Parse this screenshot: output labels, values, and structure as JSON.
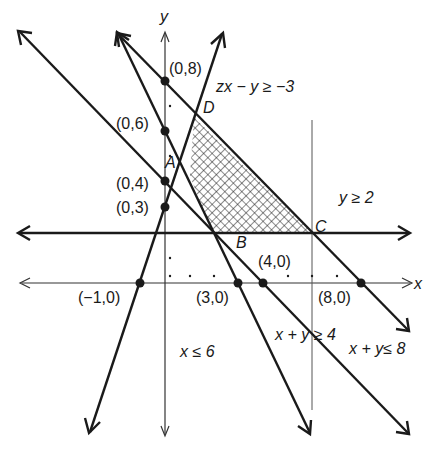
{
  "figure": {
    "type": "linear-programming feasible region",
    "axes": {
      "x_label": "x",
      "y_label": "y"
    },
    "points": {
      "y_intercepts": [
        {
          "label": "(0,8)"
        },
        {
          "label": "(0,6)"
        },
        {
          "label": "(0,4)"
        },
        {
          "label": "(0,3)"
        }
      ],
      "x_intercepts": [
        {
          "label": "(−1,0)"
        },
        {
          "label": "(3,0)"
        },
        {
          "label": "(4,0)"
        },
        {
          "label": "(8,0)"
        }
      ],
      "vertices": {
        "A": "A",
        "B": "B",
        "C": "C",
        "D": "D"
      }
    },
    "constraints": {
      "c1": "zx − y ≥ −3",
      "c2": "y ≥ 2",
      "c3": "x + y ≥ 4",
      "c4": "x + y≤ 8",
      "c5": "x ≤ 6"
    },
    "shading": "cross-hatched feasible region BCD",
    "colors": {
      "line": "#1a1a1a",
      "axis": "#333333",
      "background": "#ffffff"
    }
  }
}
